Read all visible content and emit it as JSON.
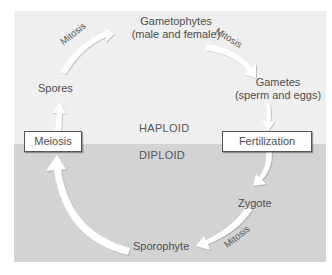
{
  "diagram": {
    "zones": {
      "top": "HAPLOID",
      "bottom": "DIPLOID"
    },
    "nodes": {
      "gametophytes_line1": "Gametophytes",
      "gametophytes_line2": "(male and female)",
      "gametes_line1": "Gametes",
      "gametes_line2": "(sperm and eggs)",
      "spores": "Spores",
      "zygote": "Zygote",
      "sporophyte": "Sporophyte"
    },
    "processes": {
      "meiosis": "Meiosis",
      "fertilization": "Fertilization"
    },
    "arrow_labels": {
      "spores_to_gametophytes": "Mitosis",
      "gametophytes_to_gametes": "Mitosis",
      "zygote_to_sporophyte": "Mitosis"
    },
    "colors": {
      "haploid_bg": "#efefef",
      "diploid_bg": "#d3d3d3",
      "arrow": "#ffffff",
      "text": "#4e4e4e"
    }
  }
}
